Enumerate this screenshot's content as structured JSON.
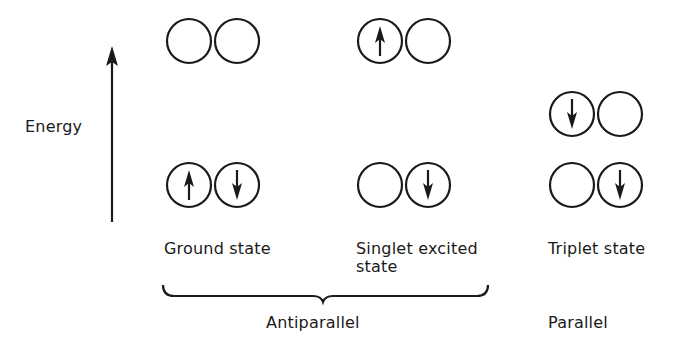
{
  "axis": {
    "label": "Energy",
    "direction": "up"
  },
  "columns": [
    {
      "id": "ground",
      "label": "Ground state",
      "upper_level": {
        "orbitals": [
          "empty",
          "empty"
        ]
      },
      "lower_level": {
        "orbitals": [
          "up",
          "down"
        ]
      }
    },
    {
      "id": "singlet",
      "label": "Singlet excited state",
      "label_line1": "Singlet excited",
      "label_line2": "state",
      "upper_level": {
        "orbitals": [
          "up",
          "empty"
        ]
      },
      "lower_level": {
        "orbitals": [
          "empty",
          "down"
        ]
      }
    },
    {
      "id": "triplet",
      "label": "Triplet state",
      "upper_level": {
        "orbitals": [
          "down",
          "empty"
        ]
      },
      "lower_level": {
        "orbitals": [
          "empty",
          "down"
        ]
      }
    }
  ],
  "groups": [
    {
      "label": "Antiparallel",
      "members": [
        "ground",
        "singlet"
      ]
    },
    {
      "label": "Parallel",
      "members": [
        "triplet"
      ]
    }
  ],
  "colors": {
    "ink": "#1a1a1a",
    "background": "#ffffff"
  }
}
